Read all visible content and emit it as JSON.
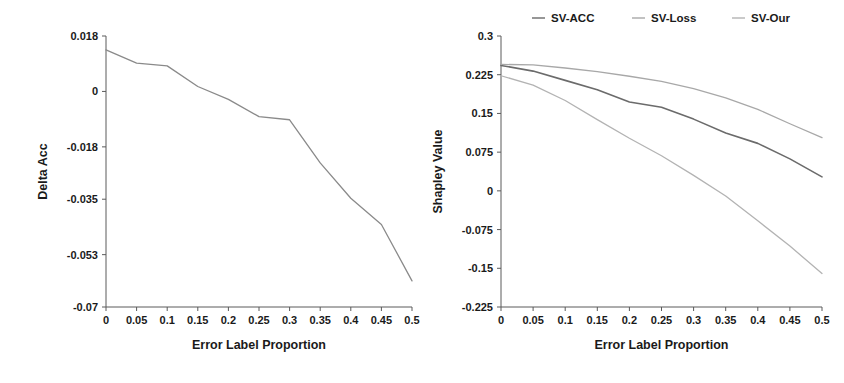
{
  "figure": {
    "background": "#ffffff",
    "width": 844,
    "height": 383
  },
  "chart_data": [
    {
      "id": "delta-acc",
      "type": "line",
      "title": "",
      "xlabel": "Error Label Proportion",
      "ylabel": "Delta Acc",
      "xlim": [
        0,
        0.5
      ],
      "ylim": [
        -0.07,
        0.018
      ],
      "grid": false,
      "legend": null,
      "xticks": [
        0,
        0.05,
        0.1,
        0.15,
        0.2,
        0.25,
        0.3,
        0.35,
        0.4,
        0.45,
        0.5
      ],
      "xticklabels": [
        "0",
        "0.05",
        "0.1",
        "0.15",
        "0.2",
        "0.25",
        "0.3",
        "0.35",
        "0.4",
        "0.45",
        "0.5"
      ],
      "yticks": [
        0.018,
        0,
        -0.018,
        -0.035,
        -0.053,
        -0.07
      ],
      "yticklabels": [
        "0.018",
        "0",
        "-0.018",
        "-0.035",
        "-0.053",
        "-0.07"
      ],
      "x": [
        0,
        0.05,
        0.1,
        0.15,
        0.2,
        0.25,
        0.3,
        0.35,
        0.4,
        0.45,
        0.5
      ],
      "series": [
        {
          "name": "Delta Acc",
          "color": "#8a8a8a",
          "width": 1.3,
          "values": [
            0.0135,
            0.0092,
            0.0083,
            0.0016,
            -0.0026,
            -0.0082,
            -0.0092,
            -0.0232,
            -0.0347,
            -0.0432,
            -0.0615
          ]
        }
      ]
    },
    {
      "id": "shapley-value",
      "type": "line",
      "title": "",
      "xlabel": "Error Label Proportion",
      "ylabel": "Shapley Value",
      "xlim": [
        0,
        0.5
      ],
      "ylim": [
        -0.225,
        0.3
      ],
      "grid": false,
      "legend_position": "top",
      "xticks": [
        0,
        0.05,
        0.1,
        0.15,
        0.2,
        0.25,
        0.3,
        0.35,
        0.4,
        0.45,
        0.5
      ],
      "xticklabels": [
        "0",
        "0.05",
        "0.1",
        "0.15",
        "0.2",
        "0.25",
        "0.3",
        "0.35",
        "0.4",
        "0.45",
        "0.5"
      ],
      "yticks": [
        0.3,
        0.225,
        0.15,
        0.075,
        0,
        -0.075,
        -0.15,
        -0.225
      ],
      "yticklabels": [
        "0.3",
        "0.225",
        "0.15",
        "0.075",
        "0",
        "-0.075",
        "-0.15",
        "-0.225"
      ],
      "x": [
        0,
        0.05,
        0.1,
        0.15,
        0.2,
        0.25,
        0.3,
        0.35,
        0.4,
        0.45,
        0.5
      ],
      "series": [
        {
          "name": "SV-ACC",
          "color": "#6b6b6b",
          "width": 1.6,
          "values": [
            0.243,
            0.232,
            0.214,
            0.196,
            0.172,
            0.162,
            0.139,
            0.112,
            0.092,
            0.062,
            0.027
          ]
        },
        {
          "name": "SV-Loss",
          "color": "#a8a8a8",
          "width": 1.3,
          "values": [
            0.245,
            0.244,
            0.238,
            0.231,
            0.222,
            0.212,
            0.198,
            0.18,
            0.158,
            0.13,
            0.103
          ]
        },
        {
          "name": "SV-Our",
          "color": "#b3b3b3",
          "width": 1.3,
          "values": [
            0.223,
            0.205,
            0.175,
            0.138,
            0.102,
            0.068,
            0.03,
            -0.01,
            -0.058,
            -0.107,
            -0.16
          ]
        }
      ]
    }
  ],
  "legend": {
    "items": [
      {
        "label": "SV-ACC",
        "color": "#6b6b6b"
      },
      {
        "label": "SV-Loss",
        "color": "#a8a8a8"
      },
      {
        "label": "SV-Our",
        "color": "#b3b3b3"
      }
    ]
  }
}
